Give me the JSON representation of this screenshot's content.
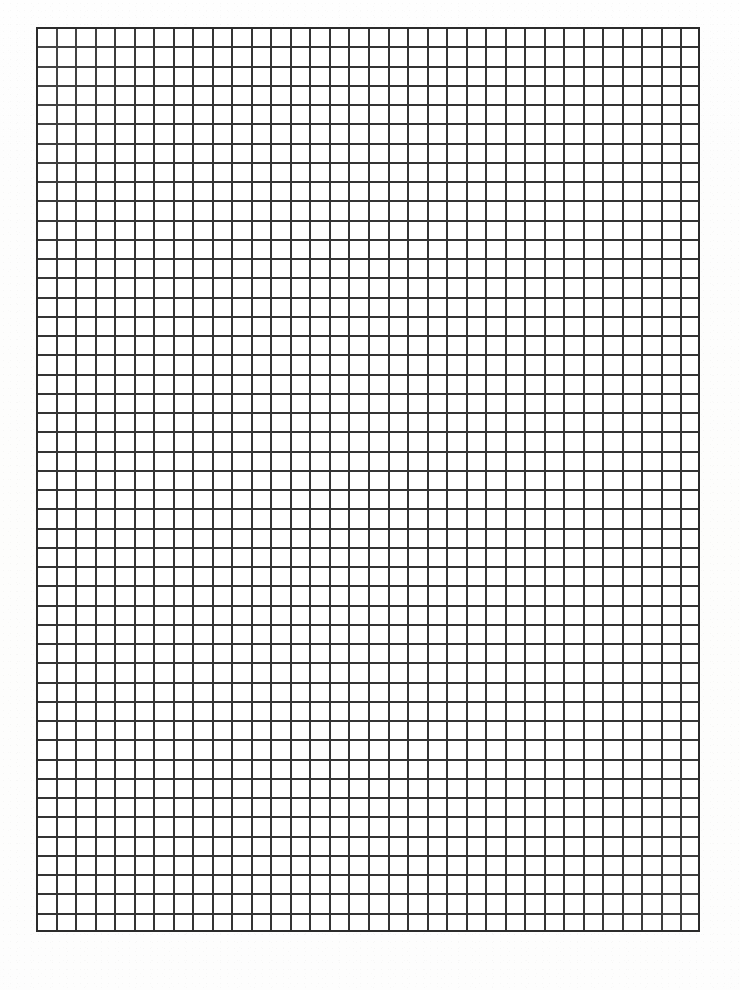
{
  "page": {
    "width_px": 740,
    "height_px": 990,
    "background_color": "#ffffff",
    "paper_color": "#fdfdfd",
    "content_label": "",
    "has_text_content": false
  },
  "grid": {
    "name": "square-graph-paper-grid",
    "columns": 34,
    "rows": 47,
    "cell_size_px": 19.2,
    "origin_x_px": 36,
    "origin_y_px": 27,
    "width_px": 664,
    "height_px": 905,
    "line_color": "#2b2b2b",
    "line_width_px": 2,
    "border_color": "#2b2b2b",
    "border_width_px": 2,
    "cell_fill_color": "#ffffff",
    "line_style": "solid",
    "uniform_line_weight": true,
    "has_major_gridlines": false
  },
  "margins": {
    "left_px": 36,
    "top_px": 27,
    "right_px": 40,
    "bottom_px": 58
  },
  "annotations": {
    "labels": [],
    "axis_labels": [],
    "title_text": "",
    "notes": ""
  }
}
